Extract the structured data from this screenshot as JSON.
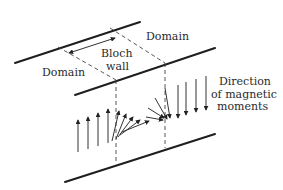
{
  "figure": {
    "labels": {
      "domain_left": "Domain",
      "domain_right": "Domain",
      "bloch_wall_line1": "Bloch",
      "bloch_wall_line2": "wall",
      "direction_line1": "Direction",
      "direction_line2": "of magnetic",
      "direction_line3": "moments"
    },
    "colors": {
      "line": "#1e1e1e",
      "dashed": "#444444",
      "text": "#2a2a2a",
      "background": "#ffffff"
    },
    "moments": {
      "up_count": 4,
      "transition_count": 8,
      "down_count": 4
    }
  }
}
